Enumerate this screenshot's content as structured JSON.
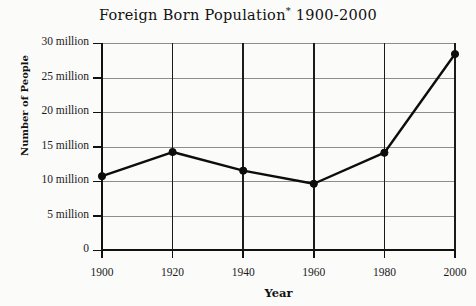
{
  "chart_data": {
    "type": "line",
    "title": "Foreign Born Population",
    "title_note_marker": "*",
    "title_range": "1900-2000",
    "xlabel": "Year",
    "ylabel": "Number of People",
    "x": [
      1900,
      1920,
      1940,
      1960,
      1980,
      2000
    ],
    "categories": [
      "1900",
      "1920",
      "1940",
      "1960",
      "1980",
      "2000"
    ],
    "values": [
      10.7,
      14.2,
      11.5,
      9.6,
      14.1,
      28.4
    ],
    "series": [
      {
        "name": "Foreign Born Population",
        "values": [
          10.7,
          14.2,
          11.5,
          9.6,
          14.1,
          28.4
        ]
      }
    ],
    "value_unit": "million",
    "xlim": [
      1900,
      2000
    ],
    "ylim": [
      0,
      30
    ],
    "ytick_values": [
      0,
      5,
      10,
      15,
      20,
      25,
      30
    ],
    "ytick_labels": [
      "0",
      "5 million",
      "10 million",
      "15 million",
      "20 million",
      "25 million",
      "30 million"
    ],
    "xtick_labels": [
      "1900",
      "1920",
      "1940",
      "1960",
      "1980",
      "2000"
    ],
    "grid": "both",
    "legend": "none",
    "marker": "filled-circle",
    "line_color": "#0d0d0d",
    "grid_color": "#8d8d8d",
    "axis_color": "#111111",
    "background_color": "#fbfbfa"
  }
}
